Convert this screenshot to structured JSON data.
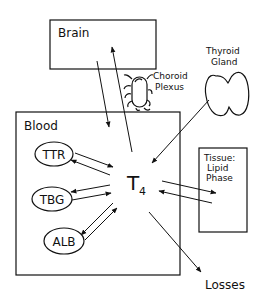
{
  "diagram": {
    "title": "",
    "compartments": {
      "brain": "Brain",
      "blood": "Blood",
      "tissue_line1": "Tissue:",
      "tissue_line2": "Lipid",
      "tissue_line3": "Phase"
    },
    "structures": {
      "choroid_line1": "Choroid",
      "choroid_line2": "Plexus",
      "thyroid_line1": "Thyroid",
      "thyroid_line2": "Gland"
    },
    "binding_proteins": [
      "TTR",
      "TBG",
      "ALB"
    ],
    "hormone": {
      "main": "T",
      "subscript": "4"
    },
    "output": "Losses",
    "edges": [
      {
        "from": "Brain",
        "to": "Blood",
        "direction": "one-way"
      },
      {
        "from": "Blood",
        "to": "Brain",
        "direction": "one-way"
      },
      {
        "from": "Thyroid Gland",
        "to": "T4",
        "direction": "one-way"
      },
      {
        "from": "TTR",
        "to": "T4",
        "direction": "bidirectional"
      },
      {
        "from": "TBG",
        "to": "T4",
        "direction": "bidirectional"
      },
      {
        "from": "ALB",
        "to": "T4",
        "direction": "bidirectional"
      },
      {
        "from": "T4",
        "to": "Tissue: Lipid Phase",
        "direction": "bidirectional"
      },
      {
        "from": "T4",
        "to": "Losses",
        "direction": "one-way"
      }
    ],
    "colors": {
      "line": "#111111",
      "background": "#ffffff"
    }
  }
}
